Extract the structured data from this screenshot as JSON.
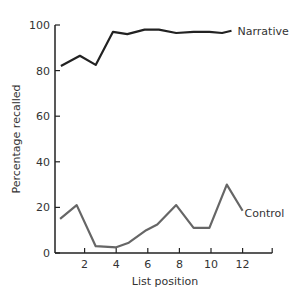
{
  "chart_data": {
    "type": "line",
    "title": "",
    "xlabel": "List position",
    "ylabel": "Percentage recalled",
    "xlim": [
      0,
      14
    ],
    "ylim": [
      0,
      100
    ],
    "xticks": [
      2,
      4,
      6,
      8,
      10,
      12
    ],
    "yticks": [
      0,
      20,
      40,
      60,
      80,
      100
    ],
    "grid": false,
    "legend": "inline labels at line ends",
    "series": [
      {
        "name": "Narrative",
        "color": "#222222",
        "x": [
          0.5,
          1.7,
          2.7,
          3.8,
          4.7,
          5.8,
          6.7,
          7.8,
          8.9,
          9.9,
          10.7,
          11.3
        ],
        "y": [
          82,
          86.5,
          82.5,
          97,
          96,
          98,
          98,
          96.5,
          97,
          97,
          96.5,
          97.5
        ]
      },
      {
        "name": "Control",
        "color": "#666666",
        "x": [
          0.45,
          1.5,
          2.7,
          4.0,
          4.8,
          5.9,
          6.6,
          7.8,
          8.9,
          9.9,
          11.0,
          12.0
        ],
        "y": [
          15,
          21,
          3,
          2.5,
          4.5,
          10,
          12.5,
          21,
          11,
          11,
          30,
          18.5
        ]
      }
    ]
  }
}
